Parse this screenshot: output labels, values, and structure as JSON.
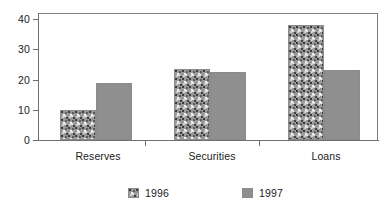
{
  "chart_data": {
    "type": "bar",
    "title": "",
    "subtitle": "",
    "xlabel": "",
    "ylabel": "",
    "categories": [
      "Reserves",
      "Securities",
      "Loans"
    ],
    "series": [
      {
        "name": "1996",
        "values": [
          10,
          23.5,
          38
        ],
        "swatch": "speckled-gray"
      },
      {
        "name": "1997",
        "values": [
          19,
          22.5,
          23
        ],
        "swatch": "solid-gray"
      }
    ],
    "ylim": [
      0,
      42
    ],
    "yticks": [
      0,
      10,
      20,
      30,
      40
    ],
    "ytick_labels": [
      "0",
      "10",
      "20",
      "30",
      "40"
    ],
    "grid": false,
    "legend_position": "bottom-center",
    "colors": {
      "series_1996": "#9a9a9a",
      "series_1997": "#8f8f8f",
      "axis": "#6f6f6f",
      "frame": "#7d7d7d",
      "text": "#1b1b1b",
      "background": "#ffffff"
    }
  }
}
